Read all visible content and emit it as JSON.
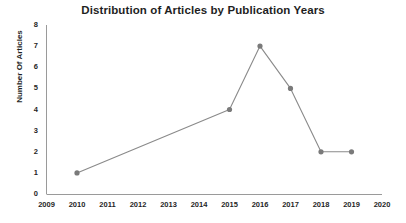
{
  "chart_data": {
    "type": "line",
    "title": "Distribution of Articles by Publication Years",
    "xlabel": "",
    "ylabel": "Number Of Articles",
    "x": [
      2010,
      2015,
      2016,
      2017,
      2018,
      2019
    ],
    "values": [
      1,
      4,
      7,
      5,
      2,
      2
    ],
    "series": [
      {
        "name": "Number Of Articles",
        "x": [
          2010,
          2015,
          2016,
          2017,
          2018,
          2019
        ],
        "values": [
          1,
          4,
          7,
          5,
          2,
          2
        ]
      }
    ],
    "xlim": [
      2009,
      2020
    ],
    "ylim": [
      0,
      8
    ],
    "x_ticks": [
      "2009",
      "2010",
      "2011",
      "2012",
      "2013",
      "2014",
      "2015",
      "2016",
      "2017",
      "2018",
      "2019",
      "2020"
    ],
    "y_ticks": [
      "0",
      "1",
      "2",
      "3",
      "4",
      "5",
      "6",
      "7",
      "8"
    ],
    "grid": false,
    "legend": false,
    "legend_position": "none",
    "marker": "circle",
    "colors": {
      "line": "#808080",
      "marker": "#7a7a7a",
      "axis": "#9a9a9a",
      "text": "#1f1f1f",
      "background": "#ffffff"
    }
  }
}
